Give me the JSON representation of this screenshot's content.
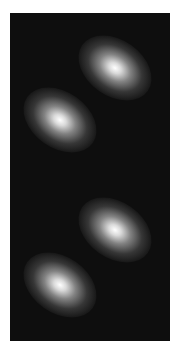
{
  "image": {
    "description": "Grayscale intensity map with four elliptical bright spots on a dark background",
    "background_color": "#0e0e0e",
    "blob_color": "#ffffff",
    "blobs": [
      {
        "cx": 105,
        "cy": 55,
        "rx": 40,
        "ry": 28
      },
      {
        "cx": 50,
        "cy": 107,
        "rx": 40,
        "ry": 28
      },
      {
        "cx": 105,
        "cy": 217,
        "rx": 40,
        "ry": 28
      },
      {
        "cx": 50,
        "cy": 272,
        "rx": 40,
        "ry": 28
      }
    ]
  }
}
